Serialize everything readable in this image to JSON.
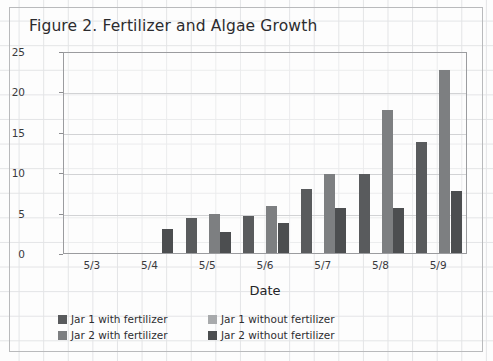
{
  "figure": {
    "title": "Figure 2. Fertilizer and Algae Growth"
  },
  "axes": {
    "y_title": "Diameter of algae (mm)",
    "x_title": "Date",
    "y_ticks": [
      "0",
      "5",
      "10",
      "15",
      "20",
      "25"
    ],
    "x_ticks": [
      "5/3",
      "5/4",
      "5/5",
      "5/6",
      "5/7",
      "5/8",
      "5/9"
    ]
  },
  "legend": {
    "items": [
      {
        "label": "Jar 1 with fertilizer",
        "color": "#595b5d"
      },
      {
        "label": "Jar 1 without fertilizer",
        "color": "#a8aaac"
      },
      {
        "label": "Jar 2 with fertilizer",
        "color": "#7d7f81"
      },
      {
        "label": "Jar 2 without fertilizer",
        "color": "#4c4e50"
      }
    ]
  },
  "chart_data": {
    "type": "bar",
    "title": "Figure 2. Fertilizer and Algae Growth",
    "xlabel": "Date",
    "ylabel": "Diameter of algae (mm)",
    "ylim": [
      0,
      25
    ],
    "ytick_step": 5,
    "grid": true,
    "legend_position": "bottom",
    "categories": [
      "5/3",
      "5/4",
      "5/5",
      "5/6",
      "5/7",
      "5/8",
      "5/9"
    ],
    "series": [
      {
        "name": "Jar 1 with fertilizer",
        "color": "#595b5d",
        "values": [
          0,
          0,
          4.3,
          4.6,
          7.9,
          9.8,
          13.7
        ]
      },
      {
        "name": "Jar 1 without fertilizer",
        "color": "#a8aaac",
        "values": [
          0,
          0,
          0,
          0,
          0,
          0,
          0
        ]
      },
      {
        "name": "Jar 2 with fertilizer",
        "color": "#7d7f81",
        "values": [
          0,
          0,
          4.8,
          5.8,
          9.8,
          17.7,
          22.7
        ]
      },
      {
        "name": "Jar 2 without fertilizer",
        "color": "#4c4e50",
        "values": [
          0,
          3.0,
          2.6,
          3.7,
          5.6,
          5.6,
          7.7
        ]
      }
    ]
  }
}
